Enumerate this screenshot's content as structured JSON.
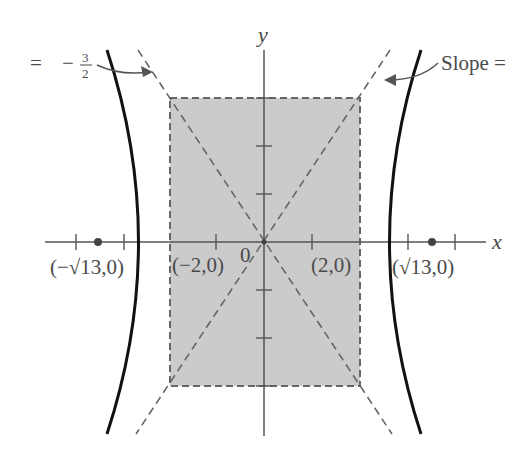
{
  "figure": {
    "axes": {
      "x_label": "x",
      "y_label": "y",
      "origin_label": "0",
      "origin_px": [
        264,
        242
      ],
      "unit_px": 48
    },
    "hyperbola": {
      "a": 2,
      "b": 3,
      "equation": "x^2/4 - y^2/9 = 1"
    },
    "points": {
      "left_focus": "(−√13,0)",
      "left_vertex": "(−2,0)",
      "right_vertex": "(2,0)",
      "right_focus": "(√13,0)"
    },
    "annotations": {
      "left_slope_prefix": "=",
      "left_slope_sign": "−",
      "left_slope_num": "3",
      "left_slope_den": "2",
      "right_slope": "Slope ="
    },
    "colors": {
      "curve": "#111111",
      "axis": "#555555",
      "dashed": "#666666",
      "rect_fill": "#c8c8c8",
      "text": "#4a4a4a"
    }
  }
}
